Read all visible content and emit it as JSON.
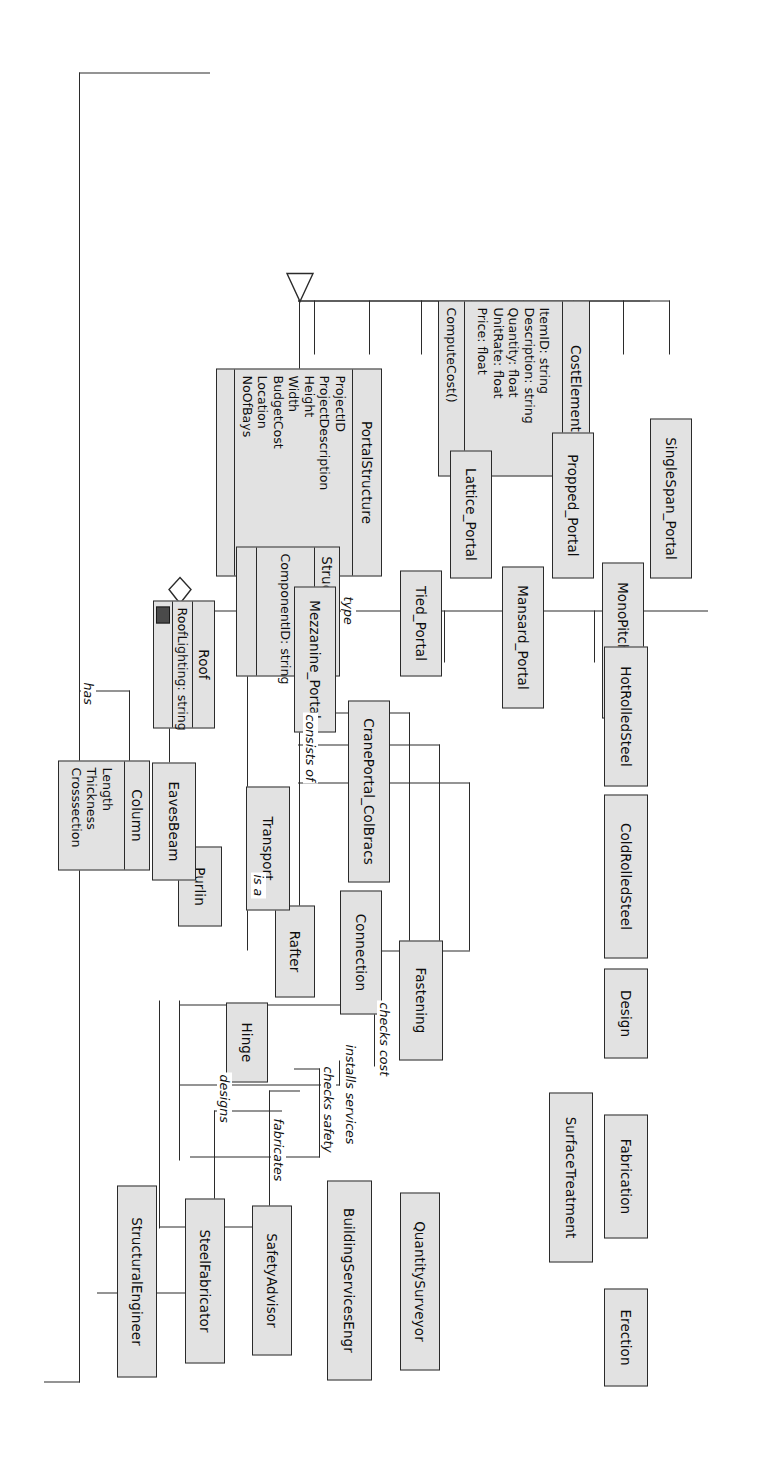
{
  "diagram": {
    "accent_fill": "#e2e2e2",
    "stroke": "#2b2b2b"
  },
  "classes": {
    "portal_structure": {
      "name": "PortalStructure",
      "attributes": [
        "ProjectID",
        "ProjectDescription",
        "Height",
        "Width",
        "BudgetCost",
        "Location",
        "NoOfBays"
      ],
      "operations": []
    },
    "roof": {
      "name": "Roof",
      "attributes": [
        "RoofLighting: string"
      ],
      "operations": [],
      "icon": "roof-image-icon"
    },
    "structural_frame": {
      "name": "StructuralFrame",
      "attributes": [
        "ComponentID: string"
      ],
      "operations": []
    },
    "cost_element": {
      "name": "CostElement",
      "attributes": [
        "ItemID: string",
        "Description: string",
        "Quantity: float",
        "UnitRate: float",
        "Price: float"
      ],
      "operations": [
        "ComputeCost()"
      ]
    },
    "column": {
      "name": "Column",
      "attributes": [
        "Length",
        "Thickness",
        "Crosssection"
      ],
      "operations": []
    }
  },
  "roles": [
    {
      "name": "StructuralEngineer"
    },
    {
      "name": "SteelFabricator"
    },
    {
      "name": "SafetyAdvisor"
    },
    {
      "name": "BuildingServicesEngr"
    },
    {
      "name": "QuantitySurveyor"
    }
  ],
  "frame_parts": [
    {
      "name": "Rafter"
    },
    {
      "name": "Connection"
    },
    {
      "name": "Hinge"
    },
    {
      "name": "Purlin"
    },
    {
      "name": "EavesBeam"
    }
  ],
  "portal_types": [
    {
      "name": "Mezzanine_Portal"
    },
    {
      "name": "CranePortal_ColBracs"
    },
    {
      "name": "Tied_Portal"
    },
    {
      "name": "Lattice_Portal"
    },
    {
      "name": "Mansard_Portal"
    },
    {
      "name": "Propped_Portal"
    },
    {
      "name": "MonoPitch_Portal"
    },
    {
      "name": "SingleSpan_Portal"
    }
  ],
  "cost_subclasses": [
    {
      "name": "Erection"
    },
    {
      "name": "Fabrication"
    },
    {
      "name": "SurfaceTreatment"
    },
    {
      "name": "Design"
    },
    {
      "name": "Fastening"
    },
    {
      "name": "ColdRolledSteel"
    },
    {
      "name": "Transport"
    },
    {
      "name": "HotRolledSteel"
    }
  ],
  "associations": [
    {
      "id": "has",
      "label": "has"
    },
    {
      "id": "designs",
      "label": "designs"
    },
    {
      "id": "fabricates",
      "label": "fabricates"
    },
    {
      "id": "checks_safety",
      "label": "checks safety"
    },
    {
      "id": "installs_services",
      "label": "installs services"
    },
    {
      "id": "checks_cost",
      "label": "checks cost"
    },
    {
      "id": "is_a",
      "label": "is a"
    },
    {
      "id": "consists_of",
      "label": "consists of"
    },
    {
      "id": "type",
      "label": "type"
    }
  ]
}
